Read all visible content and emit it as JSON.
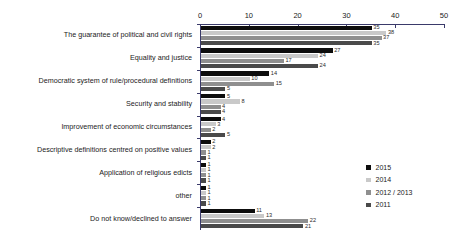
{
  "chart_data": {
    "type": "bar",
    "orientation": "horizontal",
    "title": "",
    "xlabel": "",
    "ylabel": "",
    "xlim": [
      0,
      50
    ],
    "xticks": [
      0,
      10,
      20,
      30,
      40,
      50
    ],
    "grid": false,
    "legend_position": "right-lower",
    "categories": [
      "The guarantee of political and civil rights",
      "Equality and justice",
      "Democratic system of rule/procedural definitions",
      "Security and stability",
      "Improvement of economic circumstances",
      "Descriptive definitions centred on positive values",
      "Application of religious edicts",
      "other",
      "Do not know/declined to answer"
    ],
    "series": [
      {
        "name": "2015",
        "color": "#0d0d0d",
        "values": [
          35,
          27,
          14,
          5,
          4,
          2,
          1,
          1,
          11
        ]
      },
      {
        "name": "2014",
        "color": "#c9c9c9",
        "values": [
          38,
          24,
          10,
          8,
          3,
          2,
          1,
          1,
          13
        ]
      },
      {
        "name": "2012 / 2013",
        "color": "#8f8f8f",
        "values": [
          37,
          17,
          15,
          4,
          2,
          1,
          1,
          1,
          22
        ]
      },
      {
        "name": "2011",
        "color": "#4a4a4a",
        "values": [
          35,
          24,
          5,
          4,
          5,
          1,
          1,
          1,
          21
        ]
      }
    ]
  },
  "legend": {
    "items": [
      {
        "label": "2015",
        "key": "s2015"
      },
      {
        "label": "2014",
        "key": "s2014"
      },
      {
        "label": "2012 / 2013",
        "key": "s2013"
      },
      {
        "label": "2011",
        "key": "s2011"
      }
    ]
  },
  "axis": {
    "tick_labels": [
      "0",
      "10",
      "20",
      "30",
      "40",
      "50"
    ]
  }
}
